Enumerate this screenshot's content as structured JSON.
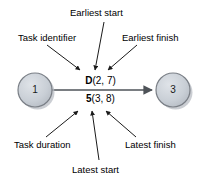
{
  "diagram": {
    "type": "activity-on-arrow-network-diagram",
    "background_color": "#ffffff",
    "node_fill_color": "#c6ccd4",
    "node_stroke_color": "#7a7f86",
    "line_color": "#5a5f66",
    "text_color": "#000000",
    "nodes": [
      {
        "id": "start-node",
        "label": "1",
        "cx": 35,
        "cy": 90,
        "r": 17
      },
      {
        "id": "end-node",
        "label": "3",
        "cx": 173,
        "cy": 90,
        "r": 17
      }
    ],
    "activity": {
      "top_line": {
        "bold": "D",
        "rest": "(2, 7)"
      },
      "bottom_line": {
        "bold": "5",
        "rest": "(3, 8)"
      }
    },
    "annotations": [
      {
        "id": "earliest-start",
        "label": "Earliest start",
        "points_to": "earliest-start-value"
      },
      {
        "id": "task-identifier",
        "label": "Task identifier",
        "points_to": "task-identifier-value"
      },
      {
        "id": "earliest-finish",
        "label": "Earliest finish",
        "points_to": "earliest-finish-value"
      },
      {
        "id": "task-duration",
        "label": "Task duration",
        "points_to": "task-duration-value"
      },
      {
        "id": "latest-finish",
        "label": "Latest finish",
        "points_to": "latest-finish-value"
      },
      {
        "id": "latest-start",
        "label": "Latest start",
        "points_to": "latest-start-value"
      }
    ]
  }
}
